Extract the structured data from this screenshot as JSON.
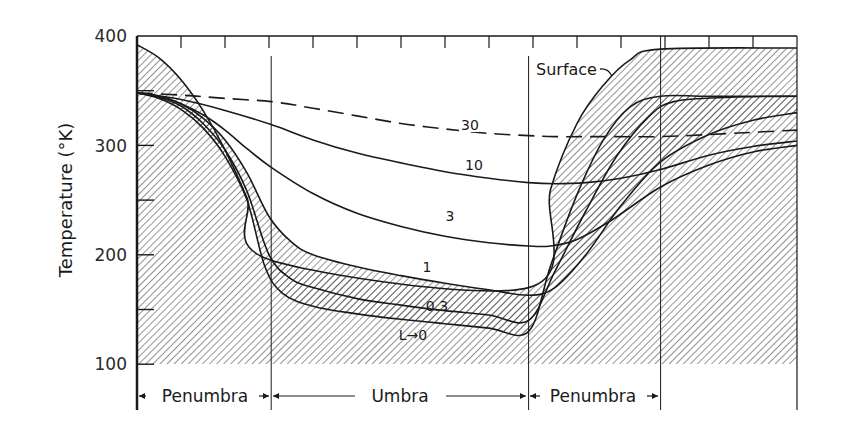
{
  "chart_data": {
    "type": "line",
    "title": "",
    "xlabel": "",
    "ylabel": "Temperature (°K)",
    "ylim": [
      100,
      400
    ],
    "yticks": [
      100,
      200,
      300,
      400
    ],
    "ytick_minor_step": 50,
    "x_tick_count": 15,
    "xlim": [
      0,
      15
    ],
    "grid": false,
    "regions": [
      {
        "label": "Penumbra",
        "x_start": 0,
        "x_end": 3.05
      },
      {
        "label": "Umbra",
        "x_start": 3.05,
        "x_end": 8.9
      },
      {
        "label": "Penumbra",
        "x_start": 8.9,
        "x_end": 11.9
      }
    ],
    "region_dividers": [
      3.05,
      8.9,
      11.9
    ],
    "hatched_floor": 100,
    "series": [
      {
        "name": "Surface",
        "label": "Surface",
        "style": "solid",
        "x": [
          0,
          0.5,
          1.0,
          1.5,
          2.0,
          2.5,
          3.05,
          3.05,
          8.9,
          8.9,
          9.4,
          10.0,
          10.6,
          11.2,
          11.9,
          15
        ],
        "y": [
          392,
          380,
          360,
          332,
          296,
          252,
          195,
          195,
          170,
          170,
          260,
          320,
          355,
          378,
          388,
          389
        ]
      },
      {
        "name": "L=0",
        "label": "L→0",
        "style": "solid",
        "x": [
          0,
          0.5,
          1.0,
          1.5,
          2.0,
          2.5,
          2.9,
          3.3,
          4.0,
          5.0,
          6.0,
          7.0,
          8.0,
          8.9,
          9.4,
          10.0,
          10.6,
          11.2,
          11.9,
          13.0,
          15
        ],
        "y": [
          348,
          343,
          333,
          316,
          290,
          250,
          190,
          165,
          153,
          146,
          141,
          137,
          133,
          130,
          190,
          255,
          305,
          335,
          345,
          345,
          345
        ]
      },
      {
        "name": "0.3",
        "label": "0.3",
        "style": "solid",
        "x": [
          0,
          0.5,
          1.0,
          1.5,
          2.0,
          2.5,
          3.0,
          3.5,
          4.0,
          5.0,
          6.0,
          7.0,
          8.0,
          8.9,
          9.5,
          10.2,
          10.9,
          11.6,
          12.2,
          13.5,
          15
        ],
        "y": [
          348,
          344,
          336,
          320,
          296,
          258,
          200,
          178,
          170,
          160,
          154,
          149,
          145,
          140,
          185,
          240,
          290,
          325,
          340,
          344,
          345
        ]
      },
      {
        "name": "1",
        "label": "1",
        "style": "solid",
        "x": [
          0,
          0.5,
          1.0,
          1.5,
          2.0,
          2.5,
          3.0,
          3.5,
          4.0,
          5.0,
          6.0,
          7.0,
          8.0,
          8.9,
          9.5,
          10.2,
          11.0,
          11.9,
          13.0,
          14.0,
          15
        ],
        "y": [
          348,
          345,
          338,
          325,
          305,
          275,
          235,
          212,
          200,
          189,
          181,
          174,
          168,
          163,
          170,
          200,
          245,
          285,
          310,
          323,
          330
        ]
      },
      {
        "name": "3",
        "label": "3",
        "style": "solid",
        "x": [
          0,
          0.5,
          1.0,
          1.5,
          2.0,
          2.5,
          3.05,
          4.0,
          5.0,
          6.0,
          7.0,
          8.0,
          8.9,
          9.4,
          10.0,
          10.8,
          11.9,
          13.0,
          14.0,
          15
        ],
        "y": [
          348,
          345,
          338,
          328,
          314,
          297,
          280,
          256,
          238,
          226,
          217,
          211,
          208,
          208,
          214,
          232,
          262,
          282,
          294,
          300
        ]
      },
      {
        "name": "10",
        "label": "10",
        "style": "solid",
        "x": [
          0,
          1.0,
          2.0,
          3.05,
          4.0,
          5.0,
          6.0,
          7.0,
          8.0,
          8.9,
          9.5,
          10.2,
          11.0,
          11.9,
          13.0,
          14.0,
          15
        ],
        "y": [
          348,
          342,
          332,
          319,
          305,
          293,
          284,
          276,
          270,
          266,
          265,
          266,
          270,
          278,
          291,
          299,
          304
        ]
      },
      {
        "name": "30",
        "label": "30",
        "style": "dashed",
        "x": [
          0,
          1.0,
          2.0,
          3.05,
          4.0,
          5.0,
          6.0,
          7.0,
          8.0,
          8.9,
          9.5,
          10.5,
          11.9,
          13.0,
          14.0,
          15
        ],
        "y": [
          348,
          346,
          343,
          340,
          334,
          327,
          320,
          315,
          311,
          309,
          308,
          308,
          308,
          310,
          312,
          314
        ]
      }
    ],
    "annotations": [
      {
        "text": "30",
        "series": "30"
      },
      {
        "text": "10",
        "series": "10"
      },
      {
        "text": "3",
        "series": "3"
      },
      {
        "text": "1",
        "series": "1"
      },
      {
        "text": "0.3",
        "series": "0.3"
      },
      {
        "text": "L→0",
        "series": "L=0"
      },
      {
        "text": "Surface",
        "series": "Surface"
      }
    ]
  },
  "axis": {
    "ylabel": "Temperature (°K)",
    "ytick_labels": [
      "400",
      "300",
      "200",
      "100"
    ]
  },
  "regions": {
    "left_penumbra": "Penumbra",
    "umbra": "Umbra",
    "right_penumbra": "Penumbra"
  },
  "labels": {
    "c30": "30",
    "c10": "10",
    "c3": "3",
    "c1": "1",
    "c03": "0.3",
    "c0": "L→0",
    "surface": "Surface"
  },
  "colors": {
    "ink": "#1a1a1a",
    "hatch": "#3a3a3a",
    "background": "#ffffff"
  }
}
